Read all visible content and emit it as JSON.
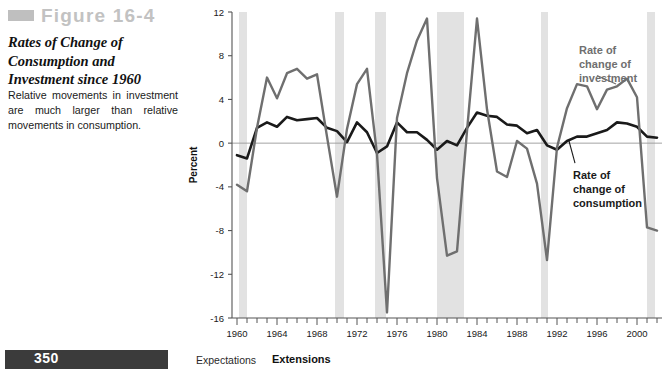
{
  "figure": {
    "label": "Figure 16-4",
    "title": "Rates of Change of Consumption and Investment since 1960",
    "description": "Relative movements in investment are much larger than relative movements in consumption."
  },
  "footer": {
    "page_number": "350",
    "chapter": "Expectations",
    "section": "Extensions"
  },
  "colors": {
    "consumption_line": "#1a1a1a",
    "investment_line": "#6f6f6f",
    "recession_band": "#e2e2e2",
    "figure_label": "#c2c2c2",
    "page_bar": "#3b3b3b",
    "axis": "#555555",
    "zero_line": "#9a9a9a"
  },
  "chart_data": {
    "type": "line",
    "title": "Rates of Change of Consumption and Investment since 1960",
    "xlabel": "",
    "ylabel": "Percent",
    "xlim": [
      1959.5,
      2002.5
    ],
    "ylim": [
      -16,
      12
    ],
    "yticks": [
      -16,
      -12,
      -8,
      -4,
      0,
      4,
      8,
      12
    ],
    "ytick_labels": [
      "-16",
      "-12",
      "-8",
      "-4",
      "0",
      "4",
      "8",
      "12"
    ],
    "xticks": [
      1960,
      1964,
      1968,
      1972,
      1976,
      1980,
      1984,
      1988,
      1992,
      1996,
      2000
    ],
    "xtick_labels": [
      "1960",
      "1964",
      "1968",
      "1972",
      "1976",
      "1980",
      "1984",
      "1988",
      "1992",
      "1996",
      "2000"
    ],
    "minor_xticks_every": 1,
    "grid": false,
    "zero_line": true,
    "legend_position": "inline-annotations",
    "annotations": [
      {
        "name": "investment-label",
        "text": "Rate of change of investment",
        "x": 1994.2,
        "y": 8.2,
        "color": "#6f6f6f"
      },
      {
        "name": "consumption-label",
        "text": "Rate of change of consumption",
        "x": 1993.6,
        "y": -3.3,
        "color": "#1a1a1a"
      }
    ],
    "recession_bands": [
      {
        "start": 1960.2,
        "end": 1961.0
      },
      {
        "start": 1969.8,
        "end": 1970.7
      },
      {
        "start": 1973.8,
        "end": 1974.9
      },
      {
        "start": 1980.0,
        "end": 1982.7
      },
      {
        "start": 1990.4,
        "end": 1991.1
      },
      {
        "start": 2001.0,
        "end": 2001.8
      }
    ],
    "x": [
      1960,
      1961,
      1962,
      1963,
      1964,
      1965,
      1966,
      1967,
      1968,
      1969,
      1970,
      1971,
      1972,
      1973,
      1974,
      1975,
      1976,
      1977,
      1978,
      1979,
      1980,
      1981,
      1982,
      1983,
      1984,
      1985,
      1986,
      1987,
      1988,
      1989,
      1990,
      1991,
      1992,
      1993,
      1994,
      1995,
      1996,
      1997,
      1998,
      1999,
      2000,
      2001,
      2002
    ],
    "series": [
      {
        "name": "Rate of change of consumption",
        "color": "#1a1a1a",
        "width": 2.6,
        "values": [
          -1.1,
          -1.4,
          1.4,
          1.9,
          1.5,
          2.4,
          2.1,
          2.2,
          2.3,
          1.4,
          1.1,
          0.1,
          1.9,
          1.0,
          -0.9,
          -0.3,
          1.9,
          1.0,
          1.0,
          0.3,
          -0.6,
          0.2,
          -0.2,
          1.4,
          2.8,
          2.5,
          2.4,
          1.7,
          1.6,
          0.9,
          1.2,
          -0.2,
          -0.6,
          0.2,
          0.6,
          0.6,
          0.9,
          1.2,
          1.9,
          1.8,
          1.5,
          0.6,
          0.5
        ]
      },
      {
        "name": "Rate of change of investment",
        "color": "#6f6f6f",
        "width": 2.4,
        "values": [
          -3.8,
          -4.4,
          1.4,
          6.0,
          4.1,
          6.4,
          6.8,
          5.9,
          6.3,
          0.6,
          -4.9,
          1.3,
          5.4,
          6.8,
          -1.0,
          -15.5,
          2.3,
          6.4,
          9.4,
          11.4,
          -3.2,
          -10.3,
          -9.9,
          1.1,
          11.4,
          3.1,
          -2.6,
          -3.1,
          0.2,
          -0.5,
          -3.7,
          -10.7,
          -0.4,
          3.2,
          5.4,
          5.2,
          3.1,
          4.9,
          5.2,
          5.9,
          4.2,
          -7.7,
          -8.0
        ]
      }
    ]
  }
}
